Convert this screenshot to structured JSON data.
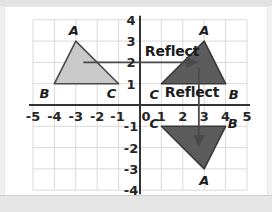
{
  "figure": {
    "type": "coordinate-plane-reflection-diagram",
    "background_color": "#ffffff",
    "grid_color": "#d9d9d9",
    "axis_color": "#333333"
  },
  "axes": {
    "x_label_values": [
      "-5",
      "-4",
      "-3",
      "-2",
      "-1",
      "0",
      "1",
      "2",
      "3",
      "4",
      "5"
    ],
    "y_label_values": [
      "4",
      "3",
      "2",
      "1",
      "-1",
      "-2",
      "-3",
      "-4"
    ],
    "origin_label": "0",
    "x_min": -5,
    "x_max": 5,
    "y_min": -4,
    "y_max": 4
  },
  "chart_data": {
    "type": "scatter",
    "title": "",
    "xlabel": "",
    "ylabel": "",
    "xlim": [
      -5,
      5
    ],
    "ylim": [
      -4,
      4
    ],
    "grid": true,
    "legend": "none",
    "shapes": [
      {
        "name": "original-triangle",
        "fill": "#c9c9c9",
        "stroke": "#4a4a4a",
        "vertices": [
          {
            "label": "A",
            "x": -3,
            "y": 3
          },
          {
            "label": "B",
            "x": -4,
            "y": 1
          },
          {
            "label": "C",
            "x": -1,
            "y": 1
          }
        ]
      },
      {
        "name": "reflected-over-y-axis-triangle",
        "fill": "#5c5c5c",
        "stroke": "#3a3a3a",
        "vertices": [
          {
            "label": "A",
            "x": 3,
            "y": 3
          },
          {
            "label": "C",
            "x": 1,
            "y": 1
          },
          {
            "label": "B",
            "x": 4,
            "y": 1
          }
        ]
      },
      {
        "name": "reflected-over-x-axis-triangle",
        "fill": "#5c5c5c",
        "stroke": "#3a3a3a",
        "vertices": [
          {
            "label": "C",
            "x": 1,
            "y": -1
          },
          {
            "label": "B",
            "x": 4,
            "y": -1
          },
          {
            "label": "A",
            "x": 3,
            "y": -3
          }
        ]
      }
    ],
    "arrows": [
      {
        "name": "horizontal-reflect-arrow",
        "label": "Reflect",
        "from": {
          "x": -2.65,
          "y": 2.0
        },
        "to": {
          "x": 2.65,
          "y": 2.0
        },
        "direction": "right"
      },
      {
        "name": "vertical-reflect-arrow",
        "label": "Reflect",
        "from": {
          "x": 2.75,
          "y": 1.75
        },
        "to": {
          "x": 2.75,
          "y": -1.9
        },
        "direction": "down"
      }
    ]
  },
  "annotations": {
    "reflect_horizontal": "Reflect",
    "reflect_vertical": "Reflect"
  },
  "vertex_labels": {
    "original": {
      "A": "A",
      "B": "B",
      "C": "C"
    },
    "reflected_y": {
      "A": "A",
      "B": "B",
      "C": "C"
    },
    "reflected_x": {
      "A": "A",
      "B": "B",
      "C": "C"
    }
  }
}
